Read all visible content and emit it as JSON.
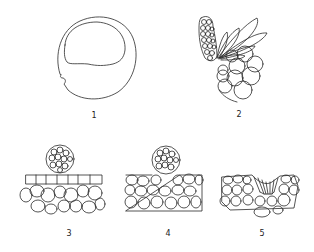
{
  "figures": [
    {
      "id": "1",
      "label": "1",
      "description": "spherical cell with large upper vacuole and notch on left"
    },
    {
      "id": "2",
      "label": "2",
      "description": "cluster of small cells with radiating elongated lobes over larger rounded cells"
    },
    {
      "id": "3",
      "label": "3",
      "description": "spherical cell cluster resting on tissue surface"
    },
    {
      "id": "4",
      "label": "4",
      "description": "spherical cell cluster partially embedded in tissue surface"
    },
    {
      "id": "5",
      "label": "5",
      "description": "tissue with depression and elongated penetrating cells"
    }
  ],
  "colors": {
    "background": "#ffffff",
    "ink": "#2a2a2a"
  }
}
